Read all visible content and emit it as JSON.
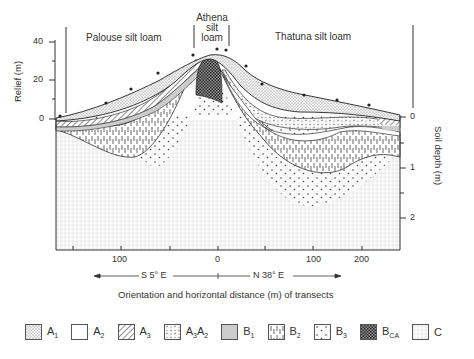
{
  "diagram": {
    "soil_series": [
      {
        "name": "Palouse silt loam"
      },
      {
        "name_line1": "Athena",
        "name_line2": "silt",
        "name_line3": "loam"
      },
      {
        "name": "Thatuna silt loam"
      }
    ],
    "left_axis": {
      "label": "Relief (m)",
      "ticks": [
        "40",
        "20",
        "0"
      ]
    },
    "right_axis": {
      "label": "Soil depth (m)",
      "ticks": [
        "0",
        "1",
        "2"
      ]
    },
    "x_axis": {
      "ticks": [
        "100",
        "0",
        "100",
        "200"
      ],
      "orientation_left": "S 5° E",
      "orientation_right": "N 38° E",
      "title": "Orientation and horizontal distance (m) of transects"
    }
  },
  "legend": [
    {
      "base": "A",
      "sub": "1",
      "pattern": "fine-dots"
    },
    {
      "base": "A",
      "sub": "2",
      "pattern": "blank"
    },
    {
      "base": "A",
      "sub": "3",
      "pattern": "diagonal-hatch"
    },
    {
      "base": "A",
      "sub": "3",
      "base2": "A",
      "sub2": "2",
      "pattern": "dashes"
    },
    {
      "base": "B",
      "sub": "1",
      "pattern": "light-gray"
    },
    {
      "base": "B",
      "sub": "2",
      "pattern": "vertical-dashes"
    },
    {
      "base": "B",
      "sub": "3",
      "pattern": "sparse-dots"
    },
    {
      "base": "B",
      "sub": "CA",
      "pattern": "dense-crosshatch"
    },
    {
      "base": "C",
      "sub": "",
      "pattern": "grid-dots"
    }
  ]
}
